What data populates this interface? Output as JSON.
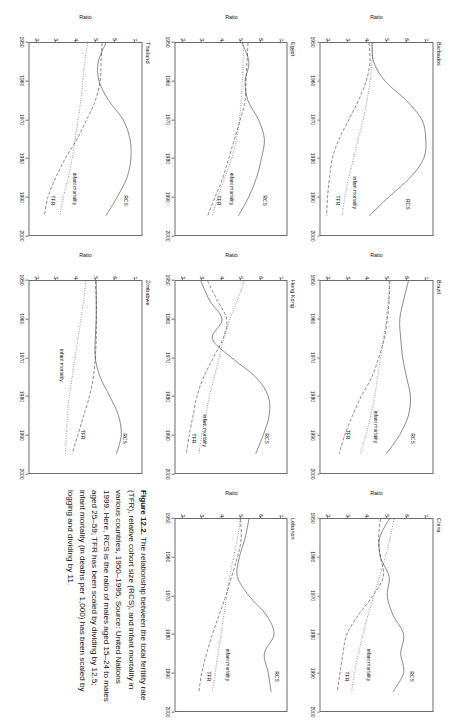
{
  "figure": {
    "caption_lead": "Figure 12.2.",
    "caption_text": " The relationship between the total fertility rate (TFR), relative cohort size (RCS), and infant mortality in various countries, 1950–1995. Source: United Nations 1999. Here, RCS is the ratio of males aged 15–24 to males aged 25–59; TFR has been scaled by dividing by 12.5; infant mortality (in deaths per 1,000) has been scaled by logging and dividing by 11."
  },
  "axes": {
    "ylabel": "Ratio",
    "xticks": [
      "1950",
      "1960",
      "1970",
      "1980",
      "1990",
      "2000"
    ],
    "yticks": [
      "7",
      "6",
      "5",
      "4",
      "3",
      "2"
    ],
    "xlim": [
      1950,
      2000
    ],
    "ylim": [
      1.6,
      7.4
    ]
  },
  "series_names": {
    "rcs": "RCS",
    "infant": "infant mortality",
    "tfr": "TFR"
  },
  "chart_data": [
    {
      "type": "line",
      "title": "Barbados",
      "xlabel": "",
      "ylabel": "Ratio",
      "xlim": [
        1950,
        2000
      ],
      "ylim": [
        1.6,
        7.4
      ],
      "grid": false,
      "legend": "inline-annotations",
      "x": [
        1950,
        1955,
        1960,
        1965,
        1970,
        1975,
        1980,
        1985,
        1990,
        1995
      ],
      "series": [
        {
          "name": "RCS",
          "style": "solid",
          "values": [
            4.25,
            4.35,
            4.95,
            6.05,
            6.85,
            7.05,
            6.95,
            6.25,
            5.15,
            4.1
          ]
        },
        {
          "name": "infant mortality",
          "style": "dotted",
          "values": [
            4.3,
            4.25,
            4.15,
            4.0,
            3.8,
            3.55,
            3.3,
            3.05,
            2.85,
            2.7
          ]
        },
        {
          "name": "TFR",
          "style": "dashed",
          "values": [
            4.1,
            4.15,
            3.95,
            3.55,
            3.05,
            2.55,
            2.2,
            2.05,
            1.95,
            1.9
          ]
        }
      ],
      "annotations": [
        {
          "text": "RCS",
          "x": 1992,
          "y": 6.1
        },
        {
          "text": "infant mortality",
          "x": 1989,
          "y": 3.35
        },
        {
          "text": "TFR",
          "x": 1991,
          "y": 2.45
        }
      ]
    },
    {
      "type": "line",
      "title": "Brazil",
      "xlabel": "",
      "ylabel": "Ratio",
      "xlim": [
        1950,
        2000
      ],
      "ylim": [
        1.6,
        7.4
      ],
      "grid": false,
      "legend": "inline-annotations",
      "x": [
        1950,
        1955,
        1960,
        1965,
        1970,
        1975,
        1980,
        1985,
        1990,
        1995
      ],
      "series": [
        {
          "name": "RCS",
          "style": "solid",
          "values": [
            6.15,
            5.9,
            5.7,
            5.75,
            5.85,
            6.05,
            6.25,
            6.15,
            5.7,
            5.0
          ]
        },
        {
          "name": "infant mortality",
          "style": "dotted",
          "values": [
            5.2,
            5.1,
            5.0,
            4.85,
            4.7,
            4.55,
            4.4,
            4.2,
            3.95,
            3.65
          ]
        },
        {
          "name": "TFR",
          "style": "dashed",
          "values": [
            5.15,
            5.15,
            5.05,
            4.9,
            4.6,
            4.25,
            3.7,
            3.25,
            2.85,
            2.55
          ]
        }
      ],
      "annotations": [
        {
          "text": "RCS",
          "x": 1991,
          "y": 6.35
        },
        {
          "text": "infant mortality",
          "x": 1988,
          "y": 4.45
        },
        {
          "text": "TFR",
          "x": 1990,
          "y": 3.0
        }
      ]
    },
    {
      "type": "line",
      "title": "China",
      "xlabel": "",
      "ylabel": "Ratio",
      "xlim": [
        1950,
        2000
      ],
      "ylim": [
        1.6,
        7.4
      ],
      "grid": false,
      "legend": "inline-annotations",
      "x": [
        1950,
        1955,
        1960,
        1965,
        1970,
        1975,
        1980,
        1985,
        1990,
        1995
      ],
      "series": [
        {
          "name": "RCS",
          "style": "solid",
          "values": [
            5.15,
            4.65,
            4.7,
            5.15,
            5.05,
            5.35,
            5.9,
            5.75,
            5.9,
            5.35
          ]
        },
        {
          "name": "infant mortality",
          "style": "dotted",
          "values": [
            5.4,
            5.2,
            4.95,
            4.65,
            4.35,
            4.05,
            3.8,
            3.55,
            3.35,
            3.2
          ]
        },
        {
          "name": "TFR",
          "style": "dashed",
          "values": [
            4.7,
            4.6,
            4.7,
            4.85,
            4.3,
            3.55,
            2.95,
            2.75,
            2.6,
            2.45
          ]
        }
      ],
      "annotations": [
        {
          "text": "RCS",
          "x": 1991,
          "y": 6.3
        },
        {
          "text": "infant mortality",
          "x": 1988,
          "y": 4.05
        },
        {
          "text": "TFR",
          "x": 1991,
          "y": 2.95
        }
      ]
    },
    {
      "type": "line",
      "title": "Egypt",
      "xlabel": "",
      "ylabel": "Ratio",
      "xlim": [
        1950,
        2000
      ],
      "ylim": [
        1.6,
        7.4
      ],
      "grid": false,
      "legend": "inline-annotations",
      "x": [
        1950,
        1955,
        1960,
        1965,
        1970,
        1975,
        1980,
        1985,
        1990,
        1995
      ],
      "series": [
        {
          "name": "RCS",
          "style": "solid",
          "values": [
            5.1,
            5.45,
            5.25,
            5.4,
            5.95,
            6.25,
            6.1,
            5.85,
            5.45,
            4.9
          ]
        },
        {
          "name": "infant mortality",
          "style": "dotted",
          "values": [
            5.15,
            5.15,
            5.1,
            5.05,
            4.95,
            4.8,
            4.55,
            4.2,
            3.85,
            3.55
          ]
        },
        {
          "name": "TFR",
          "style": "dashed",
          "values": [
            5.4,
            5.35,
            5.3,
            5.25,
            5.0,
            4.7,
            4.4,
            4.1,
            3.7,
            3.3
          ]
        }
      ],
      "annotations": [
        {
          "text": "RCS",
          "x": 1991,
          "y": 6.25
        },
        {
          "text": "infant mortality",
          "x": 1988,
          "y": 4.55
        },
        {
          "text": "TFR",
          "x": 1991,
          "y": 3.85
        }
      ]
    },
    {
      "type": "line",
      "title": "Hong Kong",
      "xlabel": "",
      "ylabel": "Ratio",
      "xlim": [
        1950,
        2000
      ],
      "ylim": [
        1.6,
        7.4
      ],
      "grid": false,
      "legend": "inline-annotations",
      "x": [
        1950,
        1955,
        1960,
        1965,
        1970,
        1975,
        1980,
        1985,
        1990,
        1995
      ],
      "series": [
        {
          "name": "RCS",
          "style": "solid",
          "values": [
            2.95,
            3.4,
            4.05,
            3.55,
            4.55,
            5.8,
            6.45,
            6.5,
            6.2,
            5.8
          ]
        },
        {
          "name": "infant mortality",
          "style": "dotted",
          "values": [
            5.2,
            4.85,
            4.45,
            4.15,
            3.9,
            3.65,
            3.4,
            3.2,
            3.0,
            2.85
          ]
        },
        {
          "name": "TFR",
          "style": "dashed",
          "values": [
            3.3,
            3.8,
            4.3,
            4.1,
            3.6,
            3.1,
            2.75,
            2.55,
            2.35,
            2.2
          ]
        }
      ],
      "annotations": [
        {
          "text": "RCS",
          "x": 1991,
          "y": 6.35
        },
        {
          "text": "infant mortality",
          "x": 1989,
          "y": 3.1
        },
        {
          "text": "TFR",
          "x": 1991,
          "y": 2.55
        }
      ]
    },
    {
      "type": "line",
      "title": "Lebanon",
      "xlabel": "",
      "ylabel": "Ratio",
      "xlim": [
        1950,
        2000
      ],
      "ylim": [
        1.6,
        7.4
      ],
      "grid": false,
      "legend": "inline-annotations",
      "x": [
        1950,
        1955,
        1960,
        1965,
        1970,
        1975,
        1980,
        1985,
        1990,
        1995
      ],
      "series": [
        {
          "name": "RCS",
          "style": "solid",
          "values": [
            5.45,
            5.25,
            4.95,
            4.85,
            5.45,
            6.35,
            6.75,
            6.25,
            6.45,
            6.6
          ]
        },
        {
          "name": "infant mortality",
          "style": "dotted",
          "values": [
            5.0,
            4.85,
            4.65,
            4.45,
            4.3,
            4.15,
            4.0,
            3.85,
            3.7,
            3.55
          ]
        },
        {
          "name": "TFR",
          "style": "dashed",
          "values": [
            5.0,
            5.05,
            4.85,
            4.55,
            4.25,
            3.9,
            3.55,
            3.25,
            3.0,
            2.85
          ]
        }
      ],
      "annotations": [
        {
          "text": "RCS",
          "x": 1991,
          "y": 6.85
        },
        {
          "text": "infant mortality",
          "x": 1988,
          "y": 4.3
        },
        {
          "text": "TFR",
          "x": 1991,
          "y": 3.35
        }
      ]
    },
    {
      "type": "line",
      "title": "Thailand",
      "xlabel": "",
      "ylabel": "Ratio",
      "xlim": [
        1950,
        2000
      ],
      "ylim": [
        1.6,
        7.4
      ],
      "grid": false,
      "legend": "inline-annotations",
      "x": [
        1950,
        1955,
        1960,
        1965,
        1970,
        1975,
        1980,
        1985,
        1990,
        1995
      ],
      "series": [
        {
          "name": "RCS",
          "style": "solid",
          "values": [
            5.55,
            5.15,
            5.2,
            5.7,
            6.45,
            6.8,
            6.85,
            6.65,
            6.15,
            5.55
          ]
        },
        {
          "name": "infant mortality",
          "style": "dotted",
          "values": [
            4.6,
            4.45,
            4.35,
            4.25,
            4.1,
            3.95,
            3.8,
            3.6,
            3.35,
            3.15
          ]
        },
        {
          "name": "TFR",
          "style": "dashed",
          "values": [
            5.35,
            5.3,
            5.25,
            5.0,
            4.55,
            4.05,
            3.45,
            2.95,
            2.55,
            2.35
          ]
        }
      ],
      "annotations": [
        {
          "text": "RCS",
          "x": 1991,
          "y": 6.6
        },
        {
          "text": "infant mortality",
          "x": 1988,
          "y": 3.95
        },
        {
          "text": "TFR",
          "x": 1991,
          "y": 2.8
        }
      ]
    },
    {
      "type": "line",
      "title": "Zimbabwe",
      "xlabel": "",
      "ylabel": "Ratio",
      "xlim": [
        1950,
        2000
      ],
      "ylim": [
        1.6,
        7.4
      ],
      "grid": false,
      "legend": "inline-annotations",
      "x": [
        1950,
        1955,
        1960,
        1965,
        1970,
        1975,
        1980,
        1985,
        1990,
        1995
      ],
      "series": [
        {
          "name": "RCS",
          "style": "solid",
          "values": [
            5.05,
            5.05,
            5.05,
            5.0,
            5.0,
            5.25,
            5.75,
            6.2,
            6.35,
            6.1
          ]
        },
        {
          "name": "infant mortality",
          "style": "dotted",
          "values": [
            4.5,
            4.4,
            4.25,
            4.1,
            3.95,
            3.8,
            3.65,
            3.55,
            3.5,
            3.45
          ]
        },
        {
          "name": "TFR",
          "style": "dashed",
          "values": [
            5.0,
            5.05,
            5.05,
            5.05,
            5.0,
            4.9,
            4.7,
            4.4,
            4.1,
            3.8
          ]
        }
      ],
      "annotations": [
        {
          "text": "RCS",
          "x": 1991,
          "y": 6.55
        },
        {
          "text": "infant mortality",
          "x": 1972,
          "y": 3.25
        },
        {
          "text": "TFR",
          "x": 1990,
          "y": 4.35
        }
      ]
    }
  ]
}
